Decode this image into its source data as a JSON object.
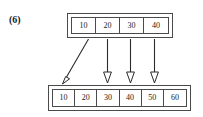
{
  "figure": {
    "label": "(6)",
    "background_color": "#ffffff",
    "line_color": "#4a4a4a",
    "text_color": "#1a1a1a"
  },
  "source_array": {
    "name": "top-array",
    "cells": [
      {
        "value": "10"
      },
      {
        "value": "20"
      },
      {
        "value": "30"
      },
      {
        "value": "40"
      }
    ]
  },
  "target_array": {
    "name": "bottom-array",
    "cells": [
      {
        "value": "10"
      },
      {
        "value": "20"
      },
      {
        "value": "30"
      },
      {
        "value": "40"
      },
      {
        "value": "50"
      },
      {
        "value": "60"
      }
    ]
  },
  "arrows": [
    {
      "name": "arrow-diagonal-10",
      "kind": "diagonal",
      "from_cell": "10",
      "to_cell": "10"
    },
    {
      "name": "arrow-vertical-20",
      "kind": "vertical",
      "from_cell": "20",
      "to_cell": "30"
    },
    {
      "name": "arrow-vertical-30",
      "kind": "vertical",
      "from_cell": "30",
      "to_cell": "40"
    },
    {
      "name": "arrow-vertical-40",
      "kind": "vertical",
      "from_cell": "40",
      "to_cell": "50"
    }
  ]
}
